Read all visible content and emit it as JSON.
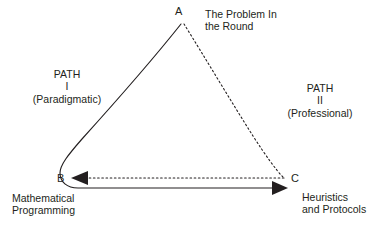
{
  "figure": {
    "background_color": "#ffffff",
    "stroke_color": "#231f20"
  },
  "vertices": [
    {
      "id": "a",
      "letter": "A",
      "caption": "The Problem In\nthe Round",
      "x": 181,
      "y": 22
    },
    {
      "id": "b",
      "letter": "B",
      "caption": "Mathematical\nProgramming",
      "x": 68,
      "y": 179
    },
    {
      "id": "c",
      "letter": "C",
      "caption": "Heuristics\nand Protocols",
      "x": 286,
      "y": 179
    }
  ],
  "paths": [
    {
      "id": "path-1",
      "label": "PATH\nI\n(Paradigmatic)",
      "name": "PATH",
      "numeral": "I",
      "qualifier": "(Paradigmatic)",
      "style": "solid",
      "from": "A",
      "via": "B",
      "to": "C",
      "arrowhead": "solid-filled-right-at-C"
    },
    {
      "id": "path-2",
      "label": "PATH\nII\n(Professional)",
      "name": "PATH",
      "numeral": "II",
      "qualifier": "(Professional)",
      "style": "dashed",
      "from": "A",
      "via": "C",
      "to": "B",
      "arrowhead": "solid-filled-left-at-B"
    }
  ]
}
